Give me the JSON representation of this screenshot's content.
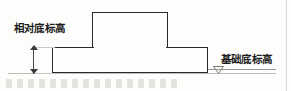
{
  "diagram": {
    "type": "engineering-cross-section",
    "title_visible": false,
    "labels": {
      "relative_bottom_elevation": "相对底标高",
      "foundation_bottom_elevation": "基础底标高"
    },
    "shapes": {
      "column_name": "column",
      "footing_name": "spread-footing"
    },
    "markers": {
      "elevation_symbol": "elevation-triangle-icon",
      "dimension_arrow_top": "arrow-up-icon",
      "dimension_arrow_bottom": "arrow-down-icon"
    },
    "colors": {
      "outline": "#2b2b2b",
      "fill": "#fefefe",
      "reference_line": "#bdbdbb",
      "text": "#1d1d1d",
      "background": "#fdfdfc"
    }
  }
}
